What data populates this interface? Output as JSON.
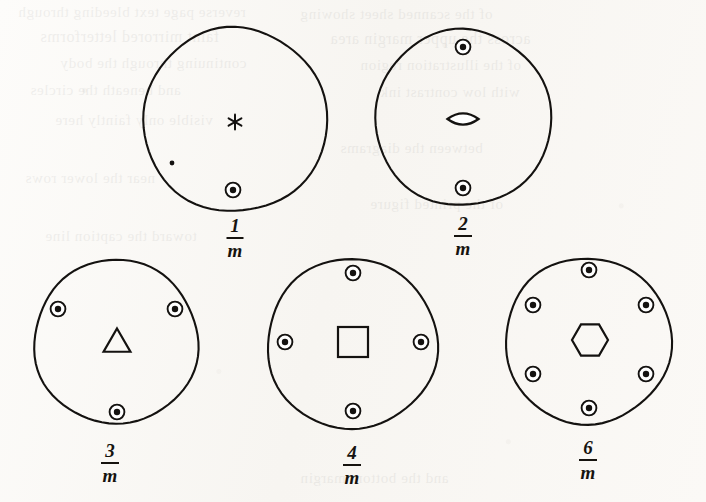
{
  "figure": {
    "kind": "crystallographic-point-group-stereograms",
    "ink_color": "#141210",
    "paper_color": "#fbfaf8",
    "width": 706,
    "height": 502
  },
  "diagrams": [
    {
      "id": "one-over-m",
      "label_numerator": "1",
      "label_denominator": "m",
      "label_text": "1/m",
      "center_x": 235,
      "center_y": 120,
      "radius": 92,
      "label_x": 235,
      "label_y": 216,
      "axis_symbol": "six-pointed-star",
      "axis_symbol_name": "star-axis-glyph",
      "axis_x": 235,
      "axis_y": 122,
      "site_count": 1,
      "sites": [
        {
          "x": 233,
          "y": 190,
          "type": "circled-dot"
        }
      ],
      "extra_marks": [
        {
          "name": "stray-speck",
          "x": 172,
          "y": 163,
          "r": 2.4
        }
      ]
    },
    {
      "id": "two-over-m",
      "label_numerator": "2",
      "label_denominator": "m",
      "label_text": "2/m",
      "center_x": 463,
      "center_y": 118,
      "radius": 88,
      "label_x": 463,
      "label_y": 214,
      "axis_symbol": "lens",
      "axis_symbol_name": "two-fold-lens-glyph",
      "axis_x": 463,
      "axis_y": 119,
      "site_count": 2,
      "sites": [
        {
          "x": 463,
          "y": 47,
          "type": "circled-dot"
        },
        {
          "x": 463,
          "y": 188,
          "type": "circled-dot"
        }
      ],
      "extra_marks": []
    },
    {
      "id": "three-over-m",
      "label_numerator": "3",
      "label_denominator": "m",
      "label_text": "3/m",
      "center_x": 116,
      "center_y": 342,
      "radius": 82,
      "label_x": 110,
      "label_y": 441,
      "axis_symbol": "triangle",
      "axis_symbol_name": "three-fold-triangle-glyph",
      "axis_x": 117,
      "axis_y": 340,
      "site_count": 3,
      "sites": [
        {
          "x": 58,
          "y": 309,
          "type": "circled-dot"
        },
        {
          "x": 175,
          "y": 309,
          "type": "circled-dot"
        },
        {
          "x": 117,
          "y": 412,
          "type": "circled-dot"
        }
      ],
      "extra_marks": []
    },
    {
      "id": "four-over-m",
      "label_numerator": "4",
      "label_denominator": "m",
      "label_text": "4/m",
      "center_x": 352,
      "center_y": 344,
      "radius": 85,
      "label_x": 352,
      "label_y": 443,
      "axis_symbol": "square",
      "axis_symbol_name": "four-fold-square-glyph",
      "axis_x": 353,
      "axis_y": 342,
      "site_count": 4,
      "sites": [
        {
          "x": 353,
          "y": 273,
          "type": "circled-dot"
        },
        {
          "x": 285,
          "y": 342,
          "type": "circled-dot"
        },
        {
          "x": 421,
          "y": 342,
          "type": "circled-dot"
        },
        {
          "x": 353,
          "y": 411,
          "type": "circled-dot"
        }
      ],
      "extra_marks": []
    },
    {
      "id": "six-over-m",
      "label_numerator": "6",
      "label_denominator": "m",
      "label_text": "6/m",
      "center_x": 588,
      "center_y": 341,
      "radius": 83,
      "label_x": 588,
      "label_y": 438,
      "axis_symbol": "hexagon",
      "axis_symbol_name": "six-fold-hexagon-glyph",
      "axis_x": 590,
      "axis_y": 340,
      "site_count": 6,
      "sites": [
        {
          "x": 589,
          "y": 270,
          "type": "circled-dot"
        },
        {
          "x": 533,
          "y": 305,
          "type": "circled-dot"
        },
        {
          "x": 646,
          "y": 305,
          "type": "circled-dot"
        },
        {
          "x": 533,
          "y": 374,
          "type": "circled-dot"
        },
        {
          "x": 646,
          "y": 374,
          "type": "circled-dot"
        },
        {
          "x": 589,
          "y": 408,
          "type": "circled-dot"
        }
      ],
      "extra_marks": []
    }
  ],
  "site_geometry": {
    "outer_ring_radius": 7.4,
    "inner_dot_radius": 3.2
  },
  "bleedthrough": [
    {
      "text": "reverse page text bleeding through",
      "x": 18,
      "y": 4,
      "size": 15
    },
    {
      "text": "of the scanned sheet showing",
      "x": 300,
      "y": 6,
      "size": 15
    },
    {
      "text": "faint mirrored letterforms",
      "x": 40,
      "y": 28,
      "size": 16
    },
    {
      "text": "across the upper margin area",
      "x": 330,
      "y": 30,
      "size": 16
    },
    {
      "text": "continuing through the body",
      "x": 60,
      "y": 55,
      "size": 15
    },
    {
      "text": "of the illustration region",
      "x": 360,
      "y": 57,
      "size": 15
    },
    {
      "text": "and beneath the circles",
      "x": 30,
      "y": 82,
      "size": 15
    },
    {
      "text": "with low contrast ink",
      "x": 380,
      "y": 84,
      "size": 15
    },
    {
      "text": "visible only faintly here",
      "x": 55,
      "y": 112,
      "size": 15
    },
    {
      "text": "between the diagrams",
      "x": 340,
      "y": 140,
      "size": 15
    },
    {
      "text": "near the lower rows",
      "x": 25,
      "y": 170,
      "size": 15
    },
    {
      "text": "of the printed figure",
      "x": 370,
      "y": 196,
      "size": 15
    },
    {
      "text": "toward the caption line",
      "x": 45,
      "y": 228,
      "size": 15
    },
    {
      "text": "and the bottom margin",
      "x": 300,
      "y": 470,
      "size": 15
    }
  ]
}
